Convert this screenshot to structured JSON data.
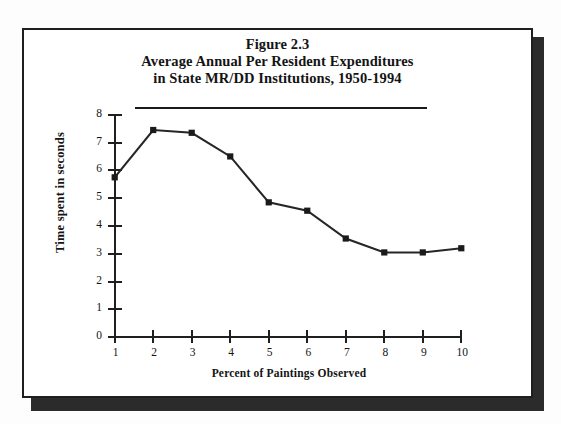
{
  "figure": {
    "title_lines": [
      "Figure 2.3",
      "Average Annual Per Resident Expenditures",
      "in State MR/DD Institutions, 1950-1994"
    ]
  },
  "chart_data": {
    "type": "line",
    "xlabel": "Percent of Paintings Observed",
    "ylabel": "Time spent in seconds",
    "x": [
      1,
      2,
      3,
      4,
      5,
      6,
      7,
      8,
      9,
      10
    ],
    "values": [
      5.75,
      7.45,
      7.35,
      6.5,
      4.85,
      4.55,
      3.55,
      3.05,
      3.05,
      3.2
    ],
    "xticklabels": [
      "1",
      "2",
      "3",
      "4",
      "5",
      "6",
      "7",
      "8",
      "9",
      "10"
    ],
    "yticklabels": [
      "0",
      "1",
      "2",
      "3",
      "4",
      "5",
      "6",
      "7",
      "8"
    ],
    "yticks": [
      0,
      1,
      2,
      3,
      4,
      5,
      6,
      7,
      8
    ],
    "xlim": [
      1,
      10
    ],
    "ylim": [
      0,
      8
    ],
    "grid": false,
    "legend": null,
    "marker": "square",
    "line_color": "#262626",
    "marker_color": "#1a1a1a"
  },
  "style": {
    "ink": "#1f1f1f",
    "paper": "#ffffff",
    "shadow": "#2b2b2b"
  }
}
